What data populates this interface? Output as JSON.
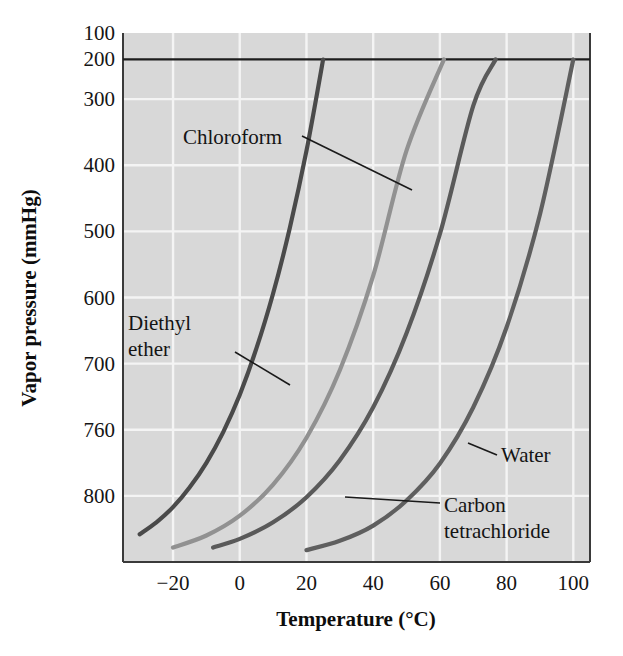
{
  "figure": {
    "background_color": "#ffffff",
    "plot_background_color": "#d8d8d8",
    "gridline_color": "#f4f4f4",
    "frame_color": "#3a3a3a"
  },
  "axes": {
    "x_title": "Temperature (°C)",
    "y_title": "Vapor pressure (mmHg)",
    "x_ticks": [
      "−20",
      "0",
      "20",
      "40",
      "60",
      "80",
      "100"
    ],
    "y_ticks": [
      "800",
      "760",
      "700",
      "600",
      "500",
      "400",
      "300",
      "200",
      "100"
    ]
  },
  "labels": {
    "chloroform": "Chloroform",
    "diethyl_ether_line1": "Diethyl",
    "diethyl_ether_line2": "ether",
    "water": "Water",
    "carbon_tet_line1": "Carbon",
    "carbon_tet_line2": "tetrachloride"
  },
  "chart_data": {
    "type": "line",
    "title": "",
    "xlabel": "Temperature (°C)",
    "ylabel": "Vapor pressure (mmHg)",
    "xlim": [
      -35,
      105
    ],
    "ylim": [
      0,
      800
    ],
    "xticks": [
      -20,
      0,
      20,
      40,
      60,
      80,
      100
    ],
    "yticks": [
      100,
      200,
      300,
      400,
      500,
      600,
      700,
      760,
      800
    ],
    "grid": true,
    "legend": "inline-annotations",
    "reference_lines": [
      {
        "name": "760 mmHg atmospheric pressure",
        "orientation": "horizontal",
        "y": 760,
        "color": "#1d1d1d"
      }
    ],
    "series": [
      {
        "name": "Diethyl ether",
        "color": "#4a4a4a",
        "x": [
          -30,
          -25,
          -20,
          -15,
          -10,
          -5,
          0,
          5,
          10,
          15,
          20,
          25,
          30,
          34.6
        ],
        "y": [
          42,
          60,
          83,
          113,
          150,
          196,
          253,
          323,
          406,
          505,
          622,
          760,
          921,
          1000
        ]
      },
      {
        "name": "Chloroform",
        "color": "#919191",
        "x": [
          -20,
          -10,
          0,
          10,
          20,
          30,
          40,
          50,
          61.2
        ],
        "y": [
          22,
          40,
          70,
          117,
          188,
          290,
          433,
          622,
          760
        ]
      },
      {
        "name": "Carbon tetrachloride",
        "color": "#5a5a5a",
        "x": [
          -8,
          0,
          10,
          20,
          30,
          40,
          50,
          60,
          70,
          76.7
        ],
        "y": [
          22,
          35,
          60,
          98,
          154,
          234,
          346,
          496,
          690,
          760
        ]
      },
      {
        "name": "Water",
        "color": "#5f5f5f",
        "x": [
          20,
          30,
          40,
          50,
          60,
          70,
          80,
          90,
          100
        ],
        "y": [
          18,
          32,
          55,
          93,
          149,
          234,
          355,
          526,
          760
        ]
      }
    ],
    "annotations": [
      {
        "text": "Chloroform",
        "x": 0.5,
        "y": 625,
        "points_to_series": "Chloroform"
      },
      {
        "text": "Diethyl ether",
        "x": -28,
        "y": 340,
        "points_to_series": "Diethyl ether"
      },
      {
        "text": "Water",
        "x": 78,
        "y": 195,
        "points_to_series": "Water"
      },
      {
        "text": "Carbon tetrachloride",
        "x": 52,
        "y": 105,
        "points_to_series": "Carbon tetrachloride"
      }
    ]
  }
}
